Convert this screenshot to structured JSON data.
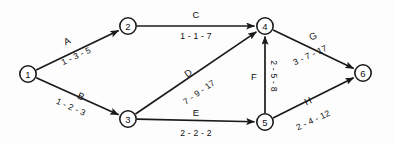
{
  "diagram": {
    "type": "activity-on-arrow-network",
    "nodes": [
      {
        "id": "1",
        "label": "1",
        "x": 28,
        "y": 74
      },
      {
        "id": "2",
        "label": "2",
        "x": 128,
        "y": 26
      },
      {
        "id": "3",
        "label": "3",
        "x": 128,
        "y": 119
      },
      {
        "id": "4",
        "label": "4",
        "x": 265,
        "y": 26
      },
      {
        "id": "5",
        "label": "5",
        "x": 265,
        "y": 122
      },
      {
        "id": "6",
        "label": "6",
        "x": 363,
        "y": 73
      }
    ],
    "node_radius": 8.2,
    "edges": [
      {
        "id": "A",
        "name": "A",
        "values": "1 - 3 - 5",
        "from": "1",
        "to": "2",
        "name_x": 67,
        "name_y": 41,
        "name_rot": -25,
        "values_x": 76,
        "values_y": 56,
        "values_rot": -25
      },
      {
        "id": "B",
        "name": "B",
        "values": "1 - 2 - 3",
        "from": "1",
        "to": "3",
        "name_x": 81,
        "name_y": 96,
        "name_rot": 24,
        "values_x": 71,
        "values_y": 107,
        "values_rot": 24
      },
      {
        "id": "C",
        "name": "C",
        "values": "1 - 1 - 7",
        "from": "2",
        "to": "4",
        "name_x": 196,
        "name_y": 14,
        "name_rot": 0,
        "values_x": 196,
        "values_y": 36,
        "values_rot": 0
      },
      {
        "id": "D",
        "name": "D",
        "values": "7 - 9 - 17",
        "from": "3",
        "to": "4",
        "name_x": 188,
        "name_y": 73,
        "name_rot": -35,
        "values_x": 199,
        "values_y": 92,
        "values_rot": -35
      },
      {
        "id": "E",
        "name": "E",
        "values": "2 - 2 - 2",
        "from": "3",
        "to": "5",
        "name_x": 196,
        "name_y": 112,
        "name_rot": 0,
        "values_x": 196,
        "values_y": 133,
        "values_rot": 0
      },
      {
        "id": "F",
        "name": "F",
        "values": "2 - 5 - 8",
        "from": "5",
        "to": "4",
        "name_x": 254,
        "name_y": 76,
        "name_rot": 0,
        "values_x": 274,
        "values_y": 76,
        "values_rot": 90
      },
      {
        "id": "G",
        "name": "G",
        "values": "3 - 7 - 17",
        "from": "4",
        "to": "6",
        "name_x": 313,
        "name_y": 36,
        "name_rot": -25,
        "values_x": 310,
        "values_y": 55,
        "values_rot": -25
      },
      {
        "id": "H",
        "name": "H",
        "values": "2 - 4 - 12",
        "from": "5",
        "to": "6",
        "name_x": 308,
        "name_y": 101,
        "name_rot": -25,
        "values_x": 313,
        "values_y": 120,
        "values_rot": -25
      }
    ],
    "colors": {
      "stroke": "#1a1a1a",
      "text": "#111111",
      "node_fill": "#ffffff",
      "background": "#fdfdfd"
    }
  }
}
